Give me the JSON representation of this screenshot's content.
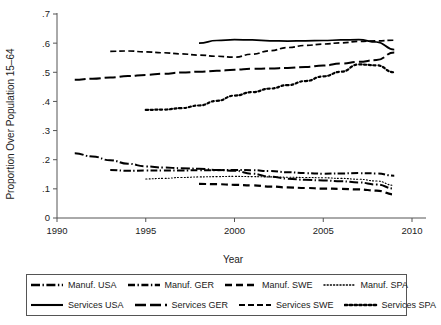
{
  "chart_data": {
    "type": "line",
    "title": "",
    "xlabel": "Year",
    "ylabel": "Proportion Over Population 15–64",
    "xlim": [
      1990,
      2010
    ],
    "ylim": [
      0,
      0.7
    ],
    "xticks": [
      1990,
      1995,
      2000,
      2005,
      2010
    ],
    "xticklabels": [
      "1990",
      "1995",
      "2000",
      "2005",
      "2010"
    ],
    "yticks": [
      0,
      0.1,
      0.2,
      0.3,
      0.4,
      0.5,
      0.6,
      0.7
    ],
    "yticklabels": [
      "0",
      ".1",
      ".2",
      ".3",
      ".4",
      ".5",
      ".6",
      ".7"
    ],
    "grid": false,
    "legend_position": "below",
    "series": [
      {
        "name": "Manuf. USA",
        "dash": "long-dash-dot",
        "x": [
          1991,
          1992,
          1993,
          1994,
          1995,
          1996,
          1997,
          1998,
          1999,
          2000,
          2001,
          2002,
          2003,
          2004,
          2005,
          2006,
          2007,
          2008,
          2009
        ],
        "values": [
          0.222,
          0.211,
          0.198,
          0.186,
          0.177,
          0.173,
          0.171,
          0.169,
          0.165,
          0.162,
          0.152,
          0.142,
          0.135,
          0.131,
          0.129,
          0.126,
          0.122,
          0.115,
          0.101
        ]
      },
      {
        "name": "Manuf. GER",
        "dash": "dash-dot",
        "x": [
          1993,
          1994,
          1995,
          1996,
          1997,
          1998,
          1999,
          2000,
          2001,
          2002,
          2003,
          2004,
          2005,
          2006,
          2007,
          2008,
          2009
        ],
        "values": [
          0.165,
          0.162,
          0.163,
          0.163,
          0.163,
          0.164,
          0.164,
          0.165,
          0.164,
          0.161,
          0.157,
          0.154,
          0.152,
          0.153,
          0.154,
          0.153,
          0.145
        ]
      },
      {
        "name": "Manuf. SWE",
        "dash": "medium-dash",
        "x": [
          1998,
          1999,
          2000,
          2001,
          2002,
          2003,
          2004,
          2005,
          2006,
          2007,
          2008,
          2009
        ],
        "values": [
          0.117,
          0.116,
          0.114,
          0.112,
          0.108,
          0.105,
          0.103,
          0.101,
          0.1,
          0.098,
          0.094,
          0.081
        ]
      },
      {
        "name": "Manuf. SPA",
        "dash": "fine-dot",
        "x": [
          1995,
          1996,
          1997,
          1998,
          1999,
          2000,
          2001,
          2002,
          2003,
          2004,
          2005,
          2006,
          2007,
          2008,
          2009
        ],
        "values": [
          0.134,
          0.136,
          0.139,
          0.141,
          0.142,
          0.143,
          0.142,
          0.141,
          0.14,
          0.139,
          0.138,
          0.136,
          0.133,
          0.127,
          0.112
        ]
      },
      {
        "name": "Services USA",
        "dash": "solid",
        "x": [
          1998,
          1999,
          2000,
          2001,
          2002,
          2003,
          2004,
          2005,
          2006,
          2007,
          2008,
          2009
        ],
        "values": [
          0.6,
          0.609,
          0.612,
          0.611,
          0.608,
          0.607,
          0.608,
          0.609,
          0.611,
          0.612,
          0.604,
          0.578
        ]
      },
      {
        "name": "Services GER",
        "dash": "long-dash",
        "x": [
          1991,
          1992,
          1993,
          1994,
          1995,
          1996,
          1997,
          1998,
          1999,
          2000,
          2001,
          2002,
          2003,
          2004,
          2005,
          2006,
          2007,
          2008,
          2009
        ],
        "values": [
          0.474,
          0.478,
          0.482,
          0.487,
          0.491,
          0.495,
          0.499,
          0.502,
          0.505,
          0.509,
          0.512,
          0.513,
          0.515,
          0.518,
          0.523,
          0.53,
          0.536,
          0.542,
          0.568
        ]
      },
      {
        "name": "Services SWE",
        "dash": "short-dash",
        "x": [
          1993,
          1994,
          1995,
          1996,
          1997,
          1998,
          1999,
          2000,
          2001,
          2002,
          2003,
          2004,
          2005,
          2006,
          2007,
          2008,
          2009
        ],
        "values": [
          0.572,
          0.573,
          0.57,
          0.567,
          0.563,
          0.559,
          0.555,
          0.552,
          0.562,
          0.574,
          0.585,
          0.592,
          0.597,
          0.601,
          0.606,
          0.608,
          0.61
        ]
      },
      {
        "name": "Services SPA",
        "dash": "dot",
        "x": [
          1995,
          1996,
          1997,
          1998,
          1999,
          2000,
          2001,
          2002,
          2003,
          2004,
          2005,
          2006,
          2007,
          2008,
          2009
        ],
        "values": [
          0.371,
          0.372,
          0.377,
          0.386,
          0.402,
          0.42,
          0.432,
          0.444,
          0.456,
          0.47,
          0.486,
          0.502,
          0.527,
          0.524,
          0.5
        ]
      }
    ]
  },
  "legend": {
    "rows": [
      [
        {
          "label": "Manuf. USA",
          "key": "long-dash-dot"
        },
        {
          "label": "Manuf. GER",
          "key": "dash-dot"
        },
        {
          "label": "Manuf. SWE",
          "key": "medium-dash"
        },
        {
          "label": "Manuf. SPA",
          "key": "fine-dot"
        }
      ],
      [
        {
          "label": "Services USA",
          "key": "solid"
        },
        {
          "label": "Services GER",
          "key": "long-dash"
        },
        {
          "label": "Services SWE",
          "key": "short-dash"
        },
        {
          "label": "Services SPA",
          "key": "dot"
        }
      ]
    ]
  },
  "colors": {
    "line": "#000000",
    "axis": "#555555",
    "text": "#1a1a1a",
    "background": "#ffffff"
  }
}
